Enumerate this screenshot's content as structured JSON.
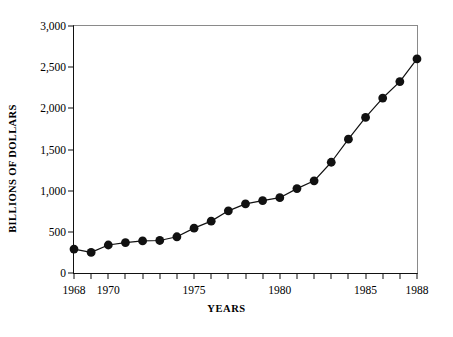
{
  "chart_data": {
    "type": "line",
    "title": "",
    "xlabel": "YEARS",
    "ylabel": "BILLIONS OF DOLLARS",
    "xlim": [
      1968,
      1988
    ],
    "ylim": [
      0,
      3000
    ],
    "grid": false,
    "legend": null,
    "marker": "filled-circle",
    "series_color": "#111111",
    "x": [
      1968,
      1969,
      1970,
      1971,
      1972,
      1973,
      1974,
      1975,
      1976,
      1977,
      1978,
      1979,
      1980,
      1981,
      1982,
      1983,
      1984,
      1985,
      1986,
      1987,
      1988
    ],
    "values": [
      290,
      250,
      340,
      370,
      390,
      395,
      440,
      545,
      630,
      755,
      840,
      880,
      915,
      1025,
      1120,
      1345,
      1625,
      1890,
      2125,
      2325,
      2600
    ],
    "categories": [
      "1968",
      "1969",
      "1970",
      "1971",
      "1972",
      "1973",
      "1974",
      "1975",
      "1976",
      "1977",
      "1978",
      "1979",
      "1980",
      "1981",
      "1982",
      "1983",
      "1984",
      "1985",
      "1986",
      "1987",
      "1988"
    ],
    "y_ticks": [
      0,
      500,
      1000,
      1500,
      2000,
      2500,
      3000
    ],
    "y_tick_labels": [
      "0",
      "500",
      "1,000",
      "1,500",
      "2,000",
      "2,500",
      "3,000"
    ],
    "x_ticks": [
      1968,
      1969,
      1970,
      1971,
      1972,
      1973,
      1974,
      1975,
      1976,
      1977,
      1978,
      1979,
      1980,
      1981,
      1982,
      1983,
      1984,
      1985,
      1986,
      1987,
      1988
    ],
    "x_tick_labels": [
      {
        "value": 1968,
        "label": "1968"
      },
      {
        "value": 1970,
        "label": "1970"
      },
      {
        "value": 1975,
        "label": "1975"
      },
      {
        "value": 1980,
        "label": "1980"
      },
      {
        "value": 1985,
        "label": "1985"
      },
      {
        "value": 1988,
        "label": "1988"
      }
    ]
  }
}
